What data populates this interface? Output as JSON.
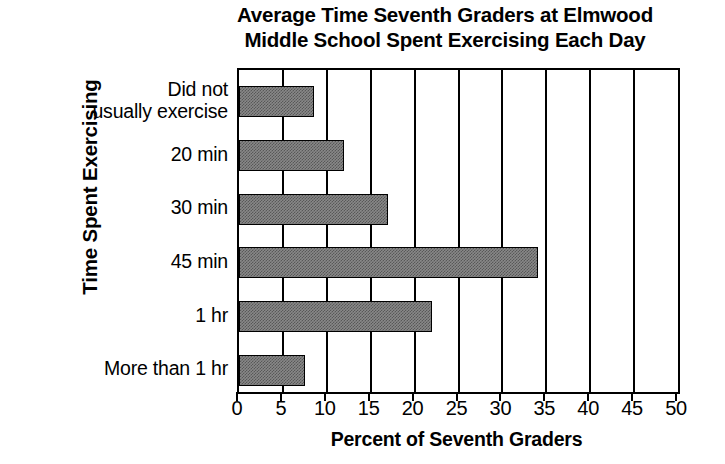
{
  "chart_data": {
    "type": "bar",
    "orientation": "horizontal",
    "title": "Average Time Seventh Graders at Elmwood Middle School Spent Exercising Each Day",
    "title_lines": [
      "Average Time Seventh Graders at Elmwood",
      "Middle School Spent Exercising Each Day"
    ],
    "categories": [
      "Did not\nusually exercise",
      "20 min",
      "30 min",
      "45 min",
      "1 hr",
      "More than 1 hr"
    ],
    "values": [
      8.5,
      12,
      17,
      34,
      22,
      7.5
    ],
    "xlabel": "Percent of Seventh Graders",
    "ylabel": "Time Spent Exercising",
    "xlim": [
      0,
      50
    ],
    "xticks": [
      0,
      5,
      10,
      15,
      20,
      25,
      30,
      35,
      40,
      45,
      50
    ],
    "xtick_labels": [
      "0",
      "5",
      "10",
      "15",
      "20",
      "25",
      "30",
      "35",
      "40",
      "45",
      "50"
    ],
    "grid": "vertical",
    "legend": "none",
    "bar_color": "#888888",
    "bar_edge_color": "#000000",
    "axis_color": "#000000",
    "background_color": "#ffffff"
  }
}
